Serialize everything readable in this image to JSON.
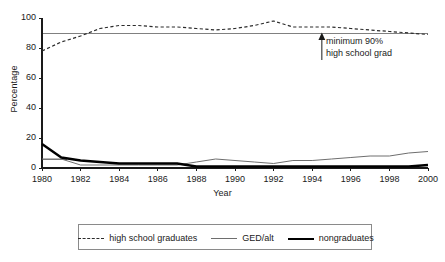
{
  "chart_data": {
    "type": "line",
    "title": "",
    "xlabel": "Year",
    "ylabel": "Percentage",
    "xlim": [
      1980,
      2000
    ],
    "ylim": [
      0,
      100
    ],
    "yticks": [
      0,
      20,
      40,
      60,
      80,
      100
    ],
    "xticks": [
      1980,
      1982,
      1984,
      1986,
      1988,
      1990,
      1992,
      1994,
      1996,
      1998,
      2000
    ],
    "grid": false,
    "legend_position": "below",
    "x": [
      1980,
      1981,
      1982,
      1983,
      1984,
      1985,
      1986,
      1987,
      1988,
      1989,
      1990,
      1991,
      1992,
      1993,
      1994,
      1995,
      1996,
      1997,
      1998,
      1999,
      2000
    ],
    "series": [
      {
        "name": "high school graduates",
        "style": "dashed",
        "color": "#2b2b2b",
        "values": [
          78,
          84,
          88,
          93,
          95,
          95,
          94,
          94,
          93,
          92,
          93,
          95,
          98,
          94,
          94,
          94,
          93,
          92,
          91,
          90,
          89
        ]
      },
      {
        "name": "GED/alt",
        "style": "thin-solid",
        "color": "#6e6e6e",
        "values": [
          6,
          6,
          2,
          2,
          2,
          2,
          2,
          2,
          4,
          6,
          5,
          4,
          3,
          5,
          5,
          6,
          7,
          8,
          8,
          10,
          11
        ]
      },
      {
        "name": "nongraduates",
        "style": "thick-solid",
        "color": "#000000",
        "values": [
          16,
          7,
          5,
          4,
          3,
          3,
          3,
          3,
          1,
          1,
          1,
          1,
          1,
          1,
          1,
          1,
          1,
          1,
          1,
          1,
          2
        ]
      }
    ],
    "reference_lines": [
      {
        "name": "minimum-90-percent",
        "value": 90,
        "color": "#808080",
        "span": "full"
      },
      {
        "name": "lower-reference",
        "value": 6,
        "color": "#808080",
        "span": "partial"
      }
    ],
    "annotations": [
      {
        "name": "minimum-90-annotation",
        "line1": "minimum 90%",
        "line2": "high school grad",
        "arrow": "up",
        "arrow_at_x": 1994.5,
        "arrow_from": 72,
        "arrow_to": 90
      }
    ],
    "legend": {
      "entries": [
        {
          "label": "high school graduates",
          "style": "dashed"
        },
        {
          "label": "GED/alt",
          "style": "thin-solid"
        },
        {
          "label": "nongraduates",
          "style": "thick-solid"
        }
      ]
    }
  }
}
